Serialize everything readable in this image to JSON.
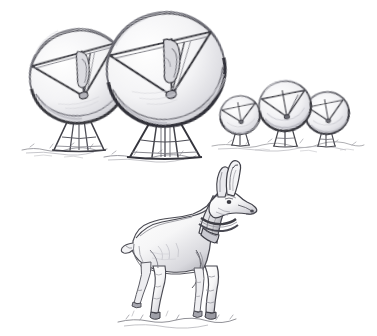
{
  "artwork": {
    "title": "Radio telescope array with pronghorn antelope",
    "medium": "graphite pencil sketch",
    "background_color": "#ffffff",
    "line_color": "#3b3b3f",
    "shade_color": "#8d8d93",
    "light_shade_color": "#c9c9ce",
    "caption": "Pencil sketch: five parabolic radio telescope dishes on pedestal mounts stand on open ground; a collared pronghorn antelope stands in the foreground looking to the right."
  },
  "scene": {
    "subjects": [
      {
        "name": "telescope-dish-left",
        "label": "Radio telescope dish (left, large)",
        "dish_center": [
          79,
          77
        ],
        "dish_radius_x": 49,
        "dish_radius_y": 46,
        "tilt_deg": -14,
        "mount_type": "four-leg pedestal",
        "ground_y": 150
      },
      {
        "name": "telescope-dish-center",
        "label": "Radio telescope dish (center, largest)",
        "dish_center": [
          166,
          70
        ],
        "dish_radius_x": 59,
        "dish_radius_y": 56,
        "tilt_deg": -12,
        "mount_type": "four-leg pedestal",
        "ground_y": 156
      },
      {
        "name": "telescope-dish-small-left",
        "label": "Radio telescope dish (small, left of pair)",
        "dish_center": [
          240,
          115
        ],
        "dish_radius_x": 20,
        "dish_radius_y": 19,
        "tilt_deg": -10,
        "mount_type": "short pedestal",
        "ground_y": 146
      },
      {
        "name": "telescope-dish-small-mid",
        "label": "Radio telescope dish (small, middle)",
        "dish_center": [
          285,
          106
        ],
        "dish_radius_x": 26,
        "dish_radius_y": 25,
        "tilt_deg": -10,
        "mount_type": "short pedestal",
        "ground_y": 146
      },
      {
        "name": "telescope-dish-small-right",
        "label": "Radio telescope dish (small, right)",
        "dish_center": [
          327,
          113
        ],
        "dish_radius_x": 22,
        "dish_radius_y": 21,
        "tilt_deg": -10,
        "mount_type": "short pedestal",
        "ground_y": 146
      },
      {
        "name": "pronghorn-antelope",
        "label": "Collared pronghorn antelope",
        "facing": "right",
        "body_center": [
          180,
          250
        ],
        "head_position": [
          228,
          196
        ],
        "accessory": "tracking collar",
        "ground_y": 322
      }
    ],
    "ground_lines": [
      {
        "name": "ground-left",
        "x1": 22,
        "x2": 100,
        "y": 150
      },
      {
        "name": "ground-center",
        "x1": 104,
        "x2": 192,
        "y": 157
      },
      {
        "name": "ground-right",
        "x1": 210,
        "x2": 360,
        "y": 147
      },
      {
        "name": "ground-animal",
        "x1": 118,
        "x2": 238,
        "y": 322
      }
    ]
  }
}
